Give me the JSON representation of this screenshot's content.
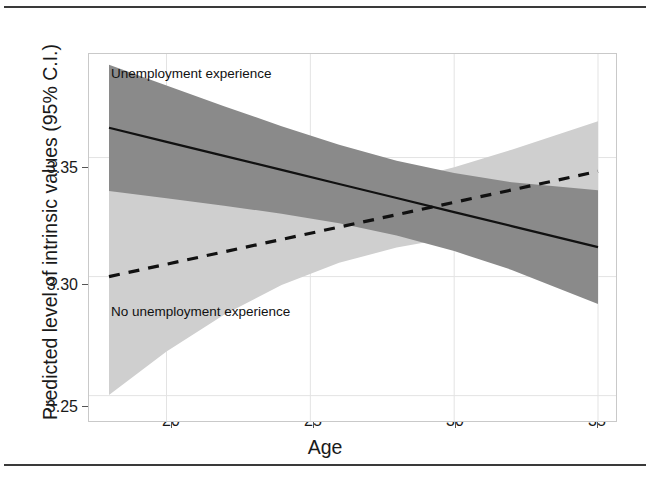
{
  "figure": {
    "has_top_rule": true,
    "has_bottom_rule": true,
    "frame_color": "#c9c9c9"
  },
  "chart_data": {
    "type": "line",
    "title": "",
    "subtitle": "",
    "xlabel": "Age",
    "ylabel": "Predicted level of intrinsic values (95% C.I.)",
    "xlim": [
      18,
      35
    ],
    "ylim": [
      3.2385,
      3.3935
    ],
    "xticks": [
      20,
      25,
      30,
      35
    ],
    "xtick_labels": [
      "20",
      "25",
      "30",
      "35"
    ],
    "yticks": [
      3.25,
      3.3,
      3.35
    ],
    "ytick_labels": [
      "3.25",
      "3.30",
      "3.35"
    ],
    "grid": true,
    "grid_color": "#e3e3e3",
    "legend_position": "inline-annotation",
    "series": [
      {
        "name": "Unemployment experience",
        "label": "Unemployment experience",
        "linestyle": "solid",
        "line_color": "#111111",
        "band_color": "#8a8a8a",
        "band_opacity": 1,
        "x": [
          18,
          20,
          22,
          24,
          26,
          28,
          30,
          32,
          35
        ],
        "values": [
          3.3625,
          3.3566,
          3.3507,
          3.3448,
          3.3389,
          3.333,
          3.3271,
          3.3212,
          3.3124
        ],
        "ci_lower": [
          3.336,
          3.3329,
          3.3298,
          3.3264,
          3.3224,
          3.3173,
          3.3107,
          3.3028,
          3.2885
        ],
        "ci_upper": [
          3.389,
          3.3803,
          3.3716,
          3.3632,
          3.3554,
          3.3487,
          3.3435,
          3.3396,
          3.3363
        ]
      },
      {
        "name": "No unemployment experience",
        "label": "No unemployment experience",
        "linestyle": "dashed",
        "line_color": "#111111",
        "band_color": "#cfcfcf",
        "band_opacity": 1,
        "x": [
          18,
          20,
          22,
          24,
          26,
          28,
          30,
          32,
          35
        ],
        "values": [
          3.3,
          3.3052,
          3.3104,
          3.3156,
          3.3208,
          3.326,
          3.3312,
          3.3364,
          3.3442
        ],
        "ci_lower": [
          3.2503,
          3.2685,
          3.284,
          3.2965,
          3.3058,
          3.3122,
          3.3165,
          3.3195,
          3.3232
        ],
        "ci_upper": [
          3.3497,
          3.3419,
          3.3368,
          3.3347,
          3.3358,
          3.3398,
          3.3459,
          3.3533,
          3.3652
        ]
      }
    ],
    "annotations": [
      {
        "text": "Unemployment experience",
        "x": 18.7,
        "y": 3.383
      },
      {
        "text": "No unemployment experience",
        "x": 18.7,
        "y": 3.29
      }
    ],
    "crossing_point": {
      "x": 29.5,
      "y": 3.3285
    }
  }
}
